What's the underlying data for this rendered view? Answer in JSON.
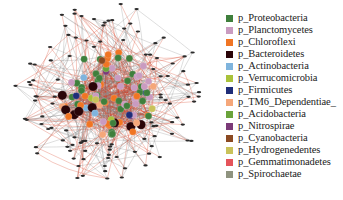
{
  "figure": {
    "type": "co-occurrence network",
    "network": {
      "center": [
        108,
        95
      ],
      "core_radius": 48,
      "outer_radius": 98,
      "edge_colors": {
        "positive": "#d9381e",
        "negative": "#8a8a8a"
      },
      "peripheral_node_color": "#2b2b2b",
      "core_node_count": 95,
      "peripheral_node_count": 110,
      "seed": 7
    },
    "legend": {
      "items": [
        {
          "label": "p_Proteobacteria",
          "color": "#3f7f3c"
        },
        {
          "label": "p_Planctomycetes",
          "color": "#c99bc0"
        },
        {
          "label": "p_Chloroflexi",
          "color": "#f07524"
        },
        {
          "label": "p_Bacteroidetes",
          "color": "#2a0508"
        },
        {
          "label": "p_Actinobacteria",
          "color": "#7fb4dd"
        },
        {
          "label": "p_Verrucomicrobia",
          "color": "#a9c23a"
        },
        {
          "label": "p_Firmicutes",
          "color": "#1f2d78"
        },
        {
          "label": "p_TM6_Dependentiae_",
          "color": "#f5a77a"
        },
        {
          "label": "p_Acidobacteria",
          "color": "#6aa33a"
        },
        {
          "label": "p_Nitrospirae",
          "color": "#7b3a78"
        },
        {
          "label": "p_Cyanobacteria",
          "color": "#8b4a22"
        },
        {
          "label": "p_Hydrogenedentes",
          "color": "#c9c25a"
        },
        {
          "label": "p_Gemmatimonadetes",
          "color": "#e5545a"
        },
        {
          "label": "p_Spirochaetae",
          "color": "#8f937f"
        }
      ]
    }
  }
}
